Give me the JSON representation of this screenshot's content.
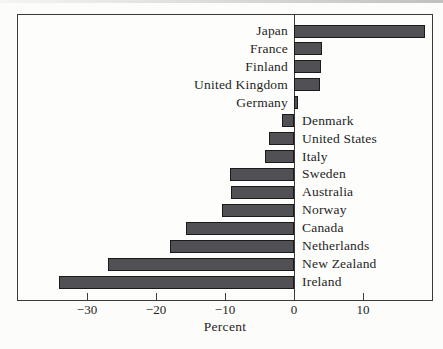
{
  "figure": {
    "background": "#fcfcfa",
    "plot_background": "#fdfdfb",
    "border_color": "#3a3a3a",
    "bar_fill": "#515155",
    "bar_border": "#1a1a1a",
    "text_color": "#1f1f1f",
    "minus_glyph": "−"
  },
  "chart_data": {
    "type": "bar",
    "orientation": "horizontal",
    "title": "",
    "xlabel": "Percent",
    "ylabel": "",
    "xlim": [
      -40,
      20
    ],
    "xticks": [
      -30,
      -20,
      -10,
      0,
      10
    ],
    "xtick_labels": [
      "−30",
      "−20",
      "−10",
      "0",
      "10"
    ],
    "grid": false,
    "zero_line": true,
    "label_placement": "opposite-side-of-zero",
    "categories": [
      "Japan",
      "France",
      "Finland",
      "United Kingdom",
      "Germany",
      "Denmark",
      "United States",
      "Italy",
      "Sweden",
      "Australia",
      "Norway",
      "Canada",
      "Netherlands",
      "New Zealand",
      "Ireland"
    ],
    "values": [
      19,
      4,
      3.9,
      3.8,
      0.6,
      -1.8,
      -3.6,
      -4.2,
      -9.3,
      -9.1,
      -10.4,
      -15.6,
      -18,
      -27,
      -34
    ]
  }
}
